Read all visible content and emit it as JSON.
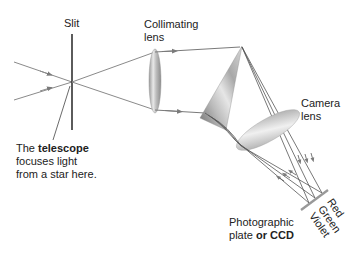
{
  "labels": {
    "slit": "Slit",
    "collimating_lens_1": "Collimating",
    "collimating_lens_2": "lens",
    "camera_lens_1": "Camera",
    "camera_lens_2": "lens",
    "telescope_1_pre": "The ",
    "telescope_1_bold": "telescope",
    "telescope_2": "focuses light",
    "telescope_3": "from a star here.",
    "plate_1": "Photographic",
    "plate_2_pre": "plate ",
    "plate_2_bold": "or CCD",
    "spectrum_red": "Red",
    "spectrum_green": "Green",
    "spectrum_violet": "Violet"
  },
  "colors": {
    "ray": "#8a8a8a",
    "ray_dark": "#555555",
    "slit": "#333333",
    "plate": "#999999",
    "text": "#222222"
  }
}
